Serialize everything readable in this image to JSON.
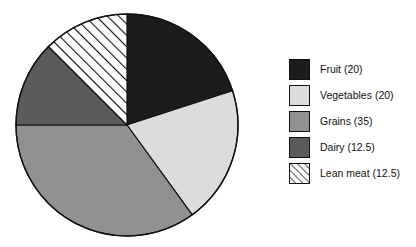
{
  "chart_data": {
    "type": "pie",
    "title": "",
    "subtitle": "",
    "xlabel": "",
    "ylabel": "",
    "grid": false,
    "legend_position": "right",
    "start_angle_deg": 0,
    "direction": "clockwise",
    "categories": [
      "Fruit",
      "Vegetables",
      "Grains",
      "Dairy",
      "Lean meat"
    ],
    "values": [
      20,
      20,
      35,
      12.5,
      12.5
    ],
    "value_unit": "",
    "total": 100,
    "slices": [
      {
        "label": "Fruit",
        "value": 20,
        "legend_text": "Fruit (20)",
        "color": "#1c1c1c",
        "pattern": "solid",
        "start_deg": 0,
        "end_deg": 72
      },
      {
        "label": "Vegetables",
        "value": 20,
        "legend_text": "Vegetables (20)",
        "color": "#dcdcdc",
        "pattern": "solid",
        "start_deg": 72,
        "end_deg": 144
      },
      {
        "label": "Grains",
        "value": 35,
        "legend_text": "Grains (35)",
        "color": "#919191",
        "pattern": "solid",
        "start_deg": 144,
        "end_deg": 270
      },
      {
        "label": "Dairy",
        "value": 12.5,
        "legend_text": "Dairy (12.5)",
        "color": "#5b5b5b",
        "pattern": "solid",
        "start_deg": 270,
        "end_deg": 315
      },
      {
        "label": "Lean meat",
        "value": 12.5,
        "legend_text": "Lean meat (12.5)",
        "color": "#ffffff",
        "pattern": "diagonal-hatch",
        "start_deg": 315,
        "end_deg": 360
      }
    ],
    "geometry": {
      "center_x": 127,
      "center_y": 125,
      "radius": 111,
      "outline_color": "#111111"
    }
  },
  "legend": {
    "items": [
      {
        "text": "Fruit (20)",
        "swatch_name": "legend-swatch-fruit"
      },
      {
        "text": "Vegetables (20)",
        "swatch_name": "legend-swatch-vegetables"
      },
      {
        "text": "Grains (35)",
        "swatch_name": "legend-swatch-grains"
      },
      {
        "text": "Dairy (12.5)",
        "swatch_name": "legend-swatch-dairy"
      },
      {
        "text": "Lean meat (12.5)",
        "swatch_name": "legend-swatch-lean-meat"
      }
    ]
  },
  "colors": {
    "background": "#ffffff",
    "text": "#111111",
    "outline": "#111111",
    "fruit": "#1c1c1c",
    "vegetables": "#dcdcdc",
    "grains": "#919191",
    "dairy": "#5b5b5b",
    "lean_meat": "#ffffff"
  }
}
